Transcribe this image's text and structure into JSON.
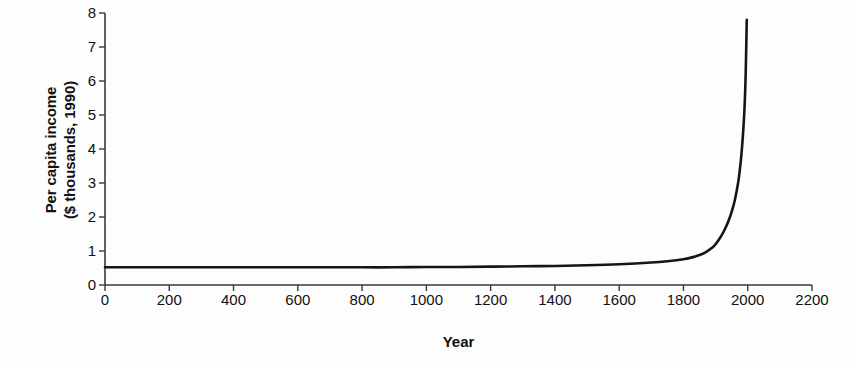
{
  "chart": {
    "title": "",
    "xlabel": "Year",
    "ylabel_line1": "Per capita income",
    "ylabel_line2": "($ thousands, 1990)",
    "line_color": "#151515",
    "axis_color": "#3a3a3a",
    "background": "#fdfdfd"
  },
  "chart_data": {
    "type": "line",
    "title": "",
    "xlabel": "Year",
    "ylabel": "Per capita income ($ thousands, 1990)",
    "xlim": [
      0,
      2200
    ],
    "ylim": [
      0,
      8
    ],
    "xticks": [
      0,
      200,
      400,
      600,
      800,
      1000,
      1200,
      1400,
      1600,
      1800,
      2000,
      2200
    ],
    "yticks": [
      0,
      1,
      2,
      3,
      4,
      5,
      6,
      7,
      8
    ],
    "xtick_labels": [
      "0",
      "200",
      "400",
      "600",
      "800",
      "1000",
      "1200",
      "1400",
      "1600",
      "1800",
      "2000",
      "2200"
    ],
    "ytick_labels": [
      "0",
      "1",
      "2",
      "3",
      "4",
      "5",
      "6",
      "7",
      "8"
    ],
    "grid": false,
    "legend": false,
    "series": [
      {
        "name": "Per capita income",
        "x": [
          0,
          100,
          200,
          300,
          400,
          500,
          600,
          700,
          800,
          900,
          1000,
          1100,
          1200,
          1300,
          1400,
          1500,
          1600,
          1700,
          1750,
          1800,
          1830,
          1850,
          1870,
          1890,
          1900,
          1910,
          1920,
          1930,
          1940,
          1950,
          1960,
          1970,
          1975,
          1980,
          1985,
          1990,
          1993,
          1995,
          1996,
          1997
        ],
        "y": [
          0.52,
          0.52,
          0.52,
          0.52,
          0.52,
          0.52,
          0.52,
          0.52,
          0.52,
          0.52,
          0.53,
          0.53,
          0.54,
          0.55,
          0.56,
          0.58,
          0.61,
          0.66,
          0.7,
          0.76,
          0.82,
          0.88,
          0.97,
          1.1,
          1.2,
          1.33,
          1.48,
          1.66,
          1.88,
          2.15,
          2.5,
          3.0,
          3.35,
          3.8,
          4.4,
          5.2,
          6.0,
          6.8,
          7.3,
          7.8
        ]
      }
    ]
  }
}
